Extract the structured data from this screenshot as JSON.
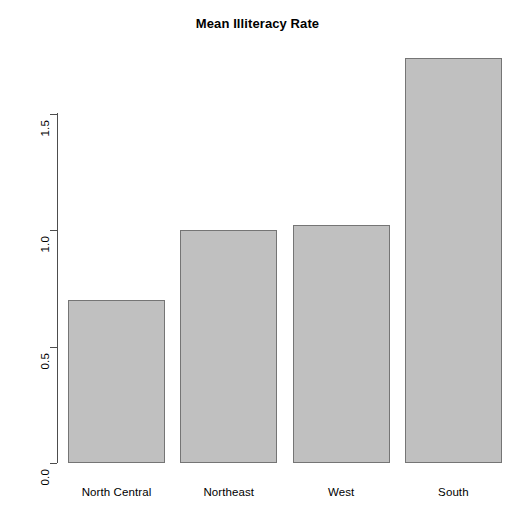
{
  "chart_data": {
    "type": "bar",
    "title": "Mean Illiteracy Rate",
    "xlabel": "",
    "ylabel": "",
    "categories": [
      "North Central",
      "Northeast",
      "West",
      "South"
    ],
    "values": [
      0.7,
      1.0,
      1.02,
      1.74
    ],
    "ylim": [
      0.0,
      1.75
    ],
    "y_ticks": [
      "0.0",
      "0.5",
      "1.0",
      "1.5"
    ],
    "y_tick_values": [
      0.0,
      0.5,
      1.0,
      1.5
    ],
    "grid": false,
    "legend": null,
    "bar_fill_color": "#c0c0c0",
    "bar_border_color": "#757575",
    "axis_color": "#4d4d4d",
    "background_color": "#ffffff"
  }
}
